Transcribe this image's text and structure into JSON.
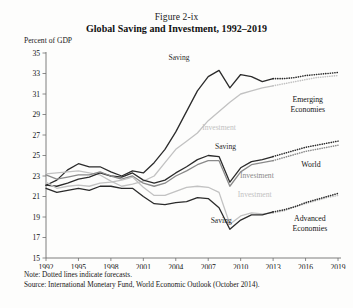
{
  "figure": {
    "caption": "Figure 2-ix",
    "title": "Global Saving and Investment, 1992–2019",
    "units_label": "Percent of GDP",
    "note": "Note: Dotted lines indicate forecasts.",
    "source": "Source: International Monetary Fund, World Economic Outlook (October 2014)."
  },
  "colors": {
    "dark": "#2b2b2b",
    "mid": "#8a8a8a",
    "light": "#c2c2c2",
    "axis": "#6f6f6f",
    "text": "#141414"
  },
  "chart_data": {
    "type": "line",
    "title": "Global Saving and Investment, 1992–2019",
    "xlabel": "",
    "ylabel": "Percent of GDP",
    "xlim": [
      1992,
      2019
    ],
    "ylim": [
      15,
      35
    ],
    "yticks": [
      15,
      17,
      19,
      21,
      23,
      25,
      27,
      29,
      31,
      33,
      35
    ],
    "xticks": [
      1992,
      1995,
      1998,
      2001,
      2004,
      2007,
      2010,
      2013,
      2016,
      2019
    ],
    "grid": false,
    "legend": "inline-annotations",
    "forecast_start_year": 2014,
    "x": [
      1992,
      1993,
      1994,
      1995,
      1996,
      1997,
      1998,
      1999,
      2000,
      2001,
      2002,
      2003,
      2004,
      2005,
      2006,
      2007,
      2008,
      2009,
      2010,
      2011,
      2012,
      2013,
      2014,
      2015,
      2016,
      2017,
      2018,
      2019
    ],
    "series": [
      {
        "name": "Emerging Economies Saving",
        "group": "Emerging Economies",
        "kind": "Saving",
        "color": "#2b2b2b",
        "width": 1.3,
        "values": [
          22.1,
          22.6,
          23.6,
          24.2,
          23.9,
          23.9,
          23.4,
          23.0,
          23.5,
          23.3,
          24.3,
          25.6,
          27.3,
          29.3,
          31.3,
          32.7,
          33.3,
          31.6,
          32.9,
          32.7,
          32.2,
          32.5,
          32.5,
          32.6,
          32.8,
          32.9,
          33.0,
          33.1
        ]
      },
      {
        "name": "Emerging Economies Investment",
        "group": "Emerging Economies",
        "kind": "Investment",
        "color": "#c2c2c2",
        "width": 1.3,
        "values": [
          23.2,
          23.3,
          23.4,
          23.5,
          23.3,
          23.1,
          22.5,
          22.0,
          22.2,
          22.5,
          23.0,
          24.3,
          25.6,
          26.4,
          27.2,
          28.4,
          29.3,
          30.2,
          31.0,
          31.3,
          31.6,
          31.8,
          32.0,
          32.2,
          32.4,
          32.6,
          32.7,
          32.8
        ]
      },
      {
        "name": "World Saving",
        "group": "World",
        "kind": "Saving",
        "color": "#2b2b2b",
        "width": 1.3,
        "values": [
          22.1,
          22.0,
          22.3,
          22.7,
          22.9,
          23.3,
          23.0,
          22.9,
          23.3,
          22.6,
          22.3,
          22.6,
          23.3,
          23.9,
          24.6,
          25.0,
          24.9,
          22.4,
          23.8,
          24.4,
          24.6,
          24.9,
          25.2,
          25.5,
          25.8,
          26.0,
          26.2,
          26.4
        ]
      },
      {
        "name": "World Investment",
        "group": "World",
        "kind": "Investment",
        "color": "#8a8a8a",
        "width": 1.3,
        "values": [
          23.1,
          22.7,
          22.9,
          23.1,
          23.1,
          23.4,
          23.0,
          22.7,
          23.0,
          22.3,
          22.0,
          22.3,
          23.0,
          23.5,
          24.1,
          24.5,
          24.5,
          22.0,
          23.4,
          24.1,
          24.3,
          24.5,
          24.8,
          25.1,
          25.4,
          25.6,
          25.8,
          26.0
        ]
      },
      {
        "name": "Advanced Economies Investment",
        "group": "Advanced Economies",
        "kind": "Investment",
        "color": "#c2c2c2",
        "width": 1.3,
        "values": [
          22.4,
          21.8,
          22.0,
          22.1,
          22.0,
          22.3,
          22.4,
          22.6,
          22.9,
          21.9,
          21.1,
          21.1,
          21.5,
          21.9,
          22.0,
          21.9,
          21.4,
          18.3,
          19.1,
          19.4,
          19.3,
          19.4,
          19.6,
          20.0,
          20.3,
          20.6,
          20.9,
          21.1
        ]
      },
      {
        "name": "Advanced Economies Saving",
        "group": "Advanced Economies",
        "kind": "Saving",
        "color": "#2b2b2b",
        "width": 1.3,
        "values": [
          21.8,
          21.4,
          21.6,
          21.8,
          21.6,
          22.0,
          22.0,
          21.8,
          21.8,
          21.0,
          20.3,
          20.2,
          20.4,
          20.5,
          20.9,
          20.8,
          19.9,
          17.8,
          18.7,
          19.2,
          19.2,
          19.5,
          19.7,
          20.0,
          20.4,
          20.7,
          21.0,
          21.3
        ]
      }
    ],
    "annotations": [
      {
        "text": "Saving",
        "x_year": 2004.3,
        "y_val": 34.3,
        "color": "#2b2b2b",
        "anchor": "middle"
      },
      {
        "text": "Investment",
        "x_year": 2008.0,
        "y_val": 27.5,
        "color": "#c2c2c2",
        "anchor": "middle"
      },
      {
        "text": "Saving",
        "x_year": 2008.6,
        "y_val": 25.6,
        "color": "#2b2b2b",
        "anchor": "middle"
      },
      {
        "text": "Investment",
        "x_year": 2011.5,
        "y_val": 22.8,
        "color": "#8a8a8a",
        "anchor": "middle"
      },
      {
        "text": "Investment",
        "x_year": 2011.3,
        "y_val": 21.0,
        "color": "#c2c2c2",
        "anchor": "middle"
      },
      {
        "text": "Saving",
        "x_year": 2008.2,
        "y_val": 18.4,
        "color": "#2b2b2b",
        "anchor": "middle"
      }
    ],
    "group_labels": [
      {
        "lines": [
          "Emerging",
          "Economies"
        ],
        "x_year": 2016.2,
        "y_val": 30.2
      },
      {
        "lines": [
          "World"
        ],
        "x_year": 2016.5,
        "y_val": 23.9
      },
      {
        "lines": [
          "Advanced",
          "Economies"
        ],
        "x_year": 2016.4,
        "y_val": 18.6
      }
    ]
  }
}
